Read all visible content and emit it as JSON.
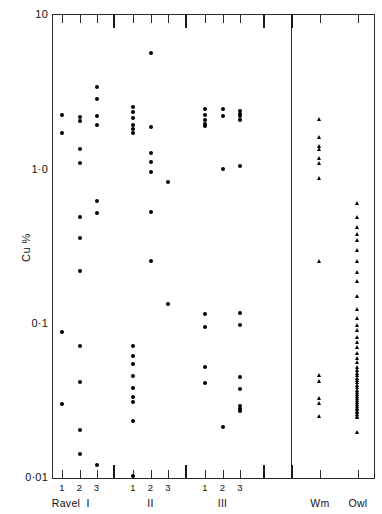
{
  "figure": {
    "background_color": "#ffffff",
    "ink_color": "#111111",
    "marker_color": "#000000"
  },
  "chart_data": {
    "type": "scatter",
    "title": "",
    "xlabel": "",
    "ylabel": "Cu %",
    "yscale": "log",
    "ylim": [
      0.01,
      10
    ],
    "ytick_labels": [
      "10",
      "1·0",
      "0·1",
      "0·01"
    ],
    "ytick_values": [
      10,
      1.0,
      0.1,
      0.01
    ],
    "grid": false,
    "legend": "none",
    "group_labels": [
      "Ravel",
      "I",
      "II",
      "III",
      "Wm",
      "Owl"
    ],
    "x_tick_labels": [
      "1",
      "2",
      "3",
      "1",
      "2",
      "3",
      "1",
      "2",
      "3"
    ],
    "marker_styles": {
      "ravel_groups": "filled-circle",
      "wm_owl": "filled-triangle"
    },
    "series": [
      {
        "name": "I-1",
        "marker": "circle",
        "values": [
          2.25,
          1.72,
          0.088,
          0.03
        ]
      },
      {
        "name": "I-2",
        "marker": "circle",
        "values": [
          2.18,
          2.05,
          1.35,
          1.1,
          0.49,
          0.36,
          0.22,
          0.072,
          0.042,
          0.0205,
          0.0143
        ]
      },
      {
        "name": "I-3",
        "marker": "circle",
        "values": [
          3.4,
          2.85,
          2.2,
          1.95,
          0.62,
          0.52,
          0.0122
        ]
      },
      {
        "name": "II-1",
        "marker": "circle",
        "values": [
          2.55,
          2.35,
          2.15,
          1.95,
          1.82,
          1.72,
          0.072,
          0.062,
          0.055,
          0.046,
          0.0385,
          0.0335,
          0.031,
          0.0235,
          0.0103
        ]
      },
      {
        "name": "II-2",
        "marker": "circle",
        "values": [
          5.7,
          1.88,
          1.28,
          1.12,
          0.96,
          0.53,
          0.255
        ]
      },
      {
        "name": "II-3",
        "marker": "circle",
        "values": [
          0.83,
          0.135
        ]
      },
      {
        "name": "III-1",
        "marker": "circle",
        "values": [
          2.45,
          2.25,
          2.08,
          1.98,
          1.9,
          0.115,
          0.095,
          0.052,
          0.0415
        ]
      },
      {
        "name": "III-2",
        "marker": "circle",
        "values": [
          2.45,
          2.2,
          1.0,
          0.0215
        ]
      },
      {
        "name": "III-3",
        "marker": "circle",
        "values": [
          2.4,
          2.3,
          2.2,
          2.1,
          1.05,
          0.118,
          0.098,
          0.045,
          0.0375,
          0.0292,
          0.028,
          0.0272
        ]
      },
      {
        "name": "Wm",
        "marker": "triangle",
        "values": [
          2.1,
          1.62,
          1.42,
          1.34,
          1.18,
          1.1,
          0.88,
          0.255,
          0.0465,
          0.0425,
          0.033,
          0.0305,
          0.025
        ]
      },
      {
        "name": "Owl",
        "marker": "triangle",
        "values": [
          0.6,
          0.49,
          0.42,
          0.38,
          0.345,
          0.3,
          0.255,
          0.215,
          0.188,
          0.15,
          0.124,
          0.108,
          0.098,
          0.09,
          0.082,
          0.076,
          0.07,
          0.064,
          0.06,
          0.056,
          0.052,
          0.05,
          0.048,
          0.046,
          0.0445,
          0.043,
          0.0415,
          0.04,
          0.0385,
          0.0372,
          0.036,
          0.0348,
          0.0338,
          0.0328,
          0.0318,
          0.031,
          0.03,
          0.0292,
          0.0285,
          0.0278,
          0.0272,
          0.0265,
          0.0258,
          0.0252,
          0.0246,
          0.0198
        ]
      }
    ]
  },
  "axes": {
    "y_labels": [
      {
        "text": "10",
        "value": 10
      },
      {
        "text": "1·0",
        "value": 1.0
      },
      {
        "text": "0·1",
        "value": 0.1
      },
      {
        "text": "0·01",
        "value": 0.01
      }
    ],
    "y_title": "Cu %",
    "x_tick_labels": [
      {
        "text": "1"
      },
      {
        "text": "2"
      },
      {
        "text": "3"
      },
      {
        "text": "1"
      },
      {
        "text": "2"
      },
      {
        "text": "3"
      },
      {
        "text": "1"
      },
      {
        "text": "2"
      },
      {
        "text": "3"
      }
    ],
    "x_group_labels": [
      {
        "text": "Ravel"
      },
      {
        "text": "I"
      },
      {
        "text": "II"
      },
      {
        "text": "III"
      },
      {
        "text": "Wm"
      },
      {
        "text": "Owl"
      }
    ]
  }
}
